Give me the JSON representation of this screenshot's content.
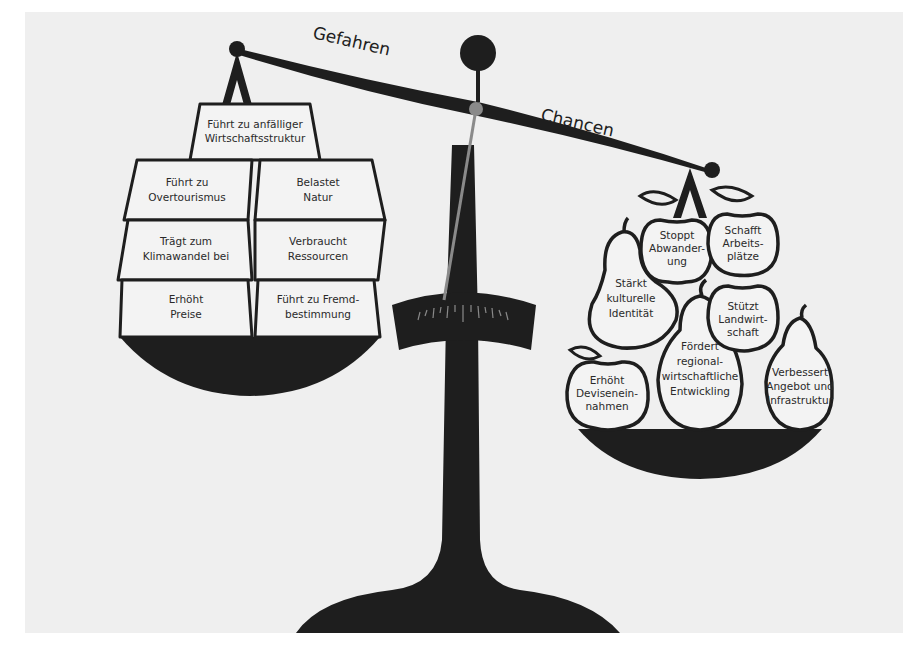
{
  "diagram": {
    "type": "balance-scale",
    "background_color": "#efefef",
    "ink_color": "#1e1e1e",
    "needle_color": "#8a8a8a",
    "beam": {
      "left_label": "Gefahren",
      "right_label": "Chancen",
      "tilt": "left side raised, right side lowered"
    },
    "left_pan": {
      "title": "Gefahren",
      "shape": "trapezoid blocks",
      "blocks": [
        {
          "id": "b1",
          "lines": [
            "Führt zu anfälliger",
            "Wirtschaftsstruktur"
          ]
        },
        {
          "id": "b2",
          "lines": [
            "Führt zu",
            "Overtourismus"
          ]
        },
        {
          "id": "b3",
          "lines": [
            "Belastet",
            "Natur"
          ]
        },
        {
          "id": "b4",
          "lines": [
            "Trägt zum",
            "Klimawandel bei"
          ]
        },
        {
          "id": "b5",
          "lines": [
            "Verbraucht",
            "Ressourcen"
          ]
        },
        {
          "id": "b6",
          "lines": [
            "Erhöht",
            "Preise"
          ]
        },
        {
          "id": "b7",
          "lines": [
            "Führt zu Fremd-",
            "bestimmung"
          ]
        }
      ]
    },
    "right_pan": {
      "title": "Chancen",
      "shape": "apples and pears",
      "fruits": [
        {
          "id": "f1",
          "kind": "apple",
          "lines": [
            "Stoppt",
            "Abwander-",
            "ung"
          ]
        },
        {
          "id": "f2",
          "kind": "apple",
          "lines": [
            "Schafft",
            "Arbeits-",
            "plätze"
          ]
        },
        {
          "id": "f3",
          "kind": "pear",
          "lines": [
            "Stärkt",
            "kulturelle",
            "Identität"
          ]
        },
        {
          "id": "f4",
          "kind": "apple",
          "lines": [
            "Stützt",
            "Landwirt-",
            "schaft"
          ]
        },
        {
          "id": "f5",
          "kind": "pear",
          "lines": [
            "Fördert",
            "regional-",
            "wirtschaftliche",
            "Entwickling"
          ]
        },
        {
          "id": "f6",
          "kind": "apple",
          "lines": [
            "Erhöht",
            "Devisenein-",
            "nahmen"
          ]
        },
        {
          "id": "f7",
          "kind": "pear",
          "lines": [
            "Verbessert",
            "Angebot und",
            "Infrastruktur"
          ]
        }
      ]
    }
  }
}
